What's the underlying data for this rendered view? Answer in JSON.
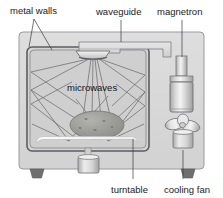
{
  "figure": {
    "background_color": "#ffffff"
  },
  "labels": {
    "metal_walls": "metal walls",
    "waveguide": "waveguide",
    "magnetron": "magnetron",
    "microwaves": "microwaves",
    "turntable": "turntable",
    "cooling_fan": "cooling fan"
  },
  "colors": {
    "body_fill": "#d9d9d9",
    "cavity_fill": "#d2d2d2",
    "outline": "#8a8a8e",
    "dark_outline": "#4a4a4e",
    "ray_stroke": "#6e6e72",
    "food_fill": "#9a9a96",
    "metal_light": "#f2f2f2",
    "metal_mid": "#c4c4c4",
    "foot_dark": "#6f6f6f",
    "text": "#1a1a1a"
  },
  "parts": [
    {
      "name": "metal-walls",
      "label": "metal walls"
    },
    {
      "name": "waveguide",
      "label": "waveguide"
    },
    {
      "name": "magnetron",
      "label": "magnetron"
    },
    {
      "name": "microwaves",
      "label": "microwaves"
    },
    {
      "name": "turntable",
      "label": "turntable"
    },
    {
      "name": "cooling-fan",
      "label": "cooling fan"
    }
  ]
}
